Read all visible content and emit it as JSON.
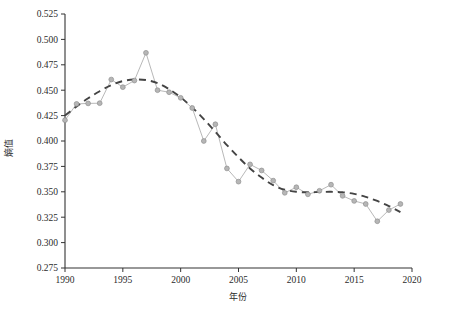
{
  "chart_data": {
    "type": "line",
    "title": "",
    "subtitle": "",
    "xlabel": "年份",
    "ylabel": "熵值",
    "xlim": [
      1990,
      2020
    ],
    "ylim": [
      0.275,
      0.525
    ],
    "grid": false,
    "legend": null,
    "x_ticks": [
      "1990",
      "1995",
      "2000",
      "2005",
      "2010",
      "2015",
      "2020"
    ],
    "x_tick_values": [
      1990,
      1995,
      2000,
      2005,
      2010,
      2015,
      2020
    ],
    "y_ticks": [
      "0.275",
      "0.300",
      "0.325",
      "0.350",
      "0.375",
      "0.400",
      "0.425",
      "0.450",
      "0.475",
      "0.500",
      "0.525"
    ],
    "y_tick_values": [
      0.275,
      0.3,
      0.325,
      0.35,
      0.375,
      0.4,
      0.425,
      0.45,
      0.475,
      0.5,
      0.525
    ],
    "x": [
      1990,
      1991,
      1992,
      1993,
      1994,
      1995,
      1996,
      1997,
      1998,
      1999,
      2000,
      2001,
      2002,
      2003,
      2004,
      2005,
      2006,
      2007,
      2008,
      2009,
      2010,
      2011,
      2012,
      2013,
      2014,
      2015,
      2016,
      2017,
      2018,
      2019
    ],
    "series": [
      {
        "name": "熵值",
        "style": "line-with-markers",
        "color": "#b0b0b0",
        "marker_color": "#b6b6b6",
        "values": [
          0.4205,
          0.4365,
          0.437,
          0.4372,
          0.4605,
          0.453,
          0.4595,
          0.4868,
          0.45,
          0.448,
          0.4425,
          0.4325,
          0.4,
          0.4165,
          0.373,
          0.36,
          0.377,
          0.371,
          0.361,
          0.349,
          0.3545,
          0.3475,
          0.351,
          0.357,
          0.346,
          0.341,
          0.338,
          0.321,
          0.332,
          0.338
        ]
      },
      {
        "name": "趋势线",
        "style": "dashed-trend",
        "color": "#444444",
        "values": [
          0.425,
          0.434,
          0.442,
          0.449,
          0.455,
          0.459,
          0.4605,
          0.46,
          0.457,
          0.451,
          0.443,
          0.433,
          0.4215,
          0.409,
          0.396,
          0.384,
          0.373,
          0.364,
          0.3565,
          0.352,
          0.35,
          0.3495,
          0.3498,
          0.35,
          0.3495,
          0.348,
          0.345,
          0.341,
          0.336,
          0.33
        ]
      }
    ]
  }
}
